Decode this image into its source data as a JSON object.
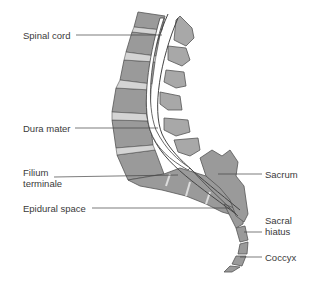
{
  "diagram": {
    "colors": {
      "vertebra_fill": "#9a9a9a",
      "disc_fill": "#d4d4d4",
      "outline": "#555555",
      "cord_fill": "#ffffff",
      "leader_line": "#444444",
      "label_text": "#3a3a3a"
    },
    "labels": {
      "spinal_cord": "Spinal cord",
      "dura_mater": "Dura mater",
      "filium_line1": "Filium",
      "filium_line2": "terminale",
      "epidural_space": "Epidural space",
      "sacrum": "Sacrum",
      "sacral_line1": "Sacral",
      "sacral_line2": "hiatus",
      "coccyx": "Coccyx"
    }
  }
}
